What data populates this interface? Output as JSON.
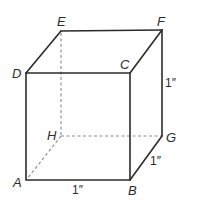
{
  "figure": {
    "type": "cube",
    "vertices": {
      "A": {
        "label": "A",
        "x": 26,
        "y": 180
      },
      "B": {
        "label": "B",
        "x": 130,
        "y": 180
      },
      "C": {
        "label": "C",
        "x": 130,
        "y": 73
      },
      "D": {
        "label": "D",
        "x": 26,
        "y": 73
      },
      "E": {
        "label": "E",
        "x": 61,
        "y": 31
      },
      "F": {
        "label": "F",
        "x": 162,
        "y": 30
      },
      "G": {
        "label": "G",
        "x": 162,
        "y": 136
      },
      "H": {
        "label": "H",
        "x": 61,
        "y": 136
      }
    },
    "visible_edges": [
      "AB",
      "BC",
      "CD",
      "DA",
      "DE",
      "EF",
      "FC",
      "FG",
      "GB"
    ],
    "hidden_edges": [
      "EH",
      "HG",
      "HA"
    ],
    "dimensions": {
      "AB": "1″",
      "FG": "1″",
      "BG": "1″"
    }
  }
}
